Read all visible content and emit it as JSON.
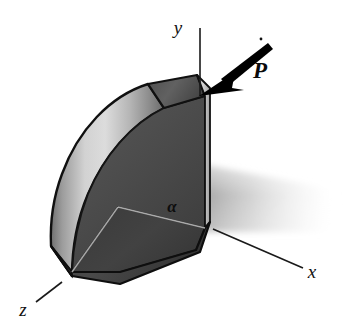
{
  "figure": {
    "background_color": "#ffffff",
    "width": 344,
    "height": 330
  },
  "axes": [
    {
      "name": "y-axis",
      "label": "y",
      "direction": "vertical-up",
      "label_x": 178,
      "label_y": 34,
      "line": {
        "x1": 200,
        "y1": 28,
        "x2": 200,
        "y2": 96
      },
      "color": "#1a1a1a"
    },
    {
      "name": "x-axis",
      "label": "x",
      "direction": "down-right",
      "label_x": 312,
      "label_y": 278,
      "line": {
        "x1": 213,
        "y1": 229,
        "x2": 303,
        "y2": 268
      },
      "color": "#1a1a1a"
    },
    {
      "name": "z-axis",
      "label": "z",
      "direction": "down-left",
      "label_x": 23,
      "label_y": 316,
      "line": {
        "x1": 62,
        "y1": 282,
        "x2": 36,
        "y2": 302
      },
      "color": "#1a1a1a"
    }
  ],
  "force": {
    "label": "P",
    "label_x": 260,
    "label_y": 76,
    "arrow_tail": {
      "x": 265,
      "y": 46
    },
    "arrow_tip": {
      "x": 200,
      "y": 95
    },
    "color": "#000000",
    "shaft_width": 6
  },
  "angle": {
    "label": "α",
    "label_x": 172,
    "label_y": 210,
    "vertex": {
      "x": 118,
      "y": 207
    },
    "color": "#0d0d0d"
  },
  "solid": {
    "name": "quarter-sector-block",
    "colors": {
      "curved_surface_light": "#d9d9d9",
      "curved_surface_mid": "#a9a9a9",
      "curved_surface_dark": "#6e6e6e",
      "sector_face": "#494949",
      "sector_face_lower": "#3a3a3a",
      "top_face": "#5b5b5b",
      "side_strip": "#c4c4c4",
      "base_face": "#3f3f3f",
      "outline": "#101010"
    }
  },
  "shadow": {
    "name": "ground-shadow",
    "color_start": "#b9b9b9",
    "color_end": "#ffffff",
    "opacity": 0.85
  }
}
